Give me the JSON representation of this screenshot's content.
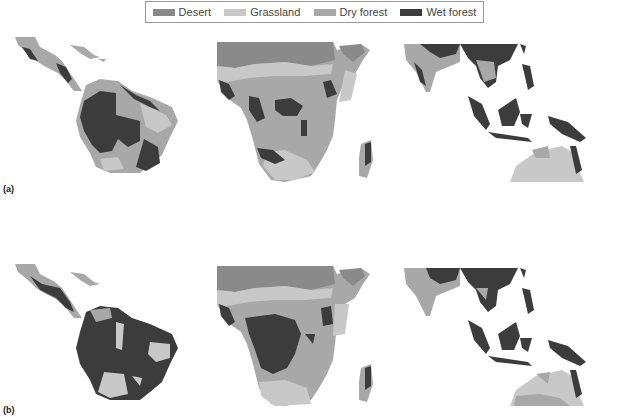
{
  "legend": {
    "items": [
      {
        "label": "Desert",
        "color": "#8a8a8a"
      },
      {
        "label": "Grassland",
        "color": "#c8c8c8"
      },
      {
        "label": "Dry forest",
        "color": "#a8a8a8"
      },
      {
        "label": "Wet forest",
        "color": "#3c3c3c"
      }
    ]
  },
  "panels": [
    {
      "label": "(a)",
      "regions": [
        "Central & South America",
        "Africa",
        "South & Southeast Asia / Australia"
      ]
    },
    {
      "label": "(b)",
      "regions": [
        "Central & South America",
        "Africa",
        "South & Southeast Asia / Australia"
      ]
    }
  ],
  "colors": {
    "desert": "#8a8a8a",
    "grassland": "#c8c8c8",
    "dry_forest": "#a8a8a8",
    "wet_forest": "#3c3c3c",
    "background": "#ffffff"
  }
}
